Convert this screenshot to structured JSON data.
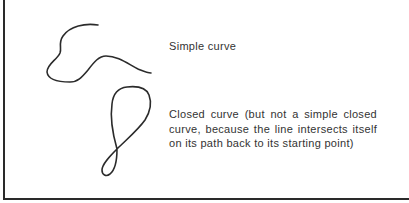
{
  "figure": {
    "items": [
      {
        "id": "simple",
        "label": "Simple curve"
      },
      {
        "id": "closed",
        "label": "Closed curve (but not a simple closed curve, because the line intersects itself on its path back to its starting point)"
      }
    ],
    "colors": {
      "stroke": "#2b2b2b",
      "text": "#333333",
      "frame": "#2a2a2a",
      "background": "#ffffff"
    }
  }
}
